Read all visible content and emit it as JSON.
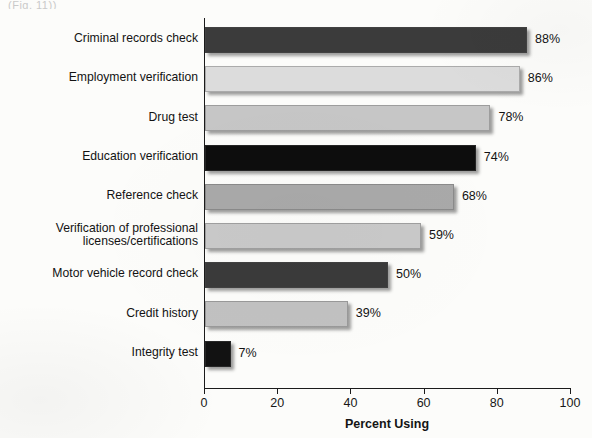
{
  "artifact_text": "(Fig. 11))",
  "chart_data": {
    "type": "bar",
    "orientation": "horizontal",
    "title": "",
    "xlabel": "Percent Using",
    "ylabel": "",
    "xlim": [
      0,
      100
    ],
    "xticks": [
      0,
      20,
      40,
      60,
      80,
      100
    ],
    "xtick_labels": [
      "0",
      "20",
      "40",
      "60",
      "80",
      "100"
    ],
    "grid": false,
    "legend": "none",
    "value_suffix": "%",
    "categories": [
      "Criminal records check",
      "Employment verification",
      "Drug test",
      "Education verification",
      "Reference check",
      "Verification of professional\nlicenses/certifications",
      "Motor vehicle record check",
      "Credit history",
      "Integrity test"
    ],
    "values": [
      88,
      86,
      78,
      74,
      68,
      59,
      50,
      39,
      7
    ],
    "value_labels": [
      "88%",
      "86%",
      "78%",
      "74%",
      "68%",
      "59%",
      "50%",
      "39%",
      "7%"
    ],
    "bar_colors": [
      "#3b3b3b",
      "#dcdcdc",
      "#c6c6c6",
      "#0d0d0d",
      "#a9a9a9",
      "#c9c9c9",
      "#3a3a3a",
      "#c1c1c1",
      "#121212"
    ]
  }
}
